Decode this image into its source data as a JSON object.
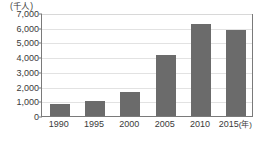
{
  "chart_data": {
    "type": "bar",
    "title": "",
    "xlabel": "年",
    "ylabel": "千人",
    "unit_label": "(千人)",
    "axis_suffix": "(年)",
    "categories": [
      "1990",
      "1995",
      "2000",
      "2005",
      "2010",
      "2015"
    ],
    "values": [
      800,
      1030,
      1650,
      4120,
      6270,
      5840
    ],
    "ylim": [
      0,
      7000
    ],
    "ytick_step": 1000,
    "ytick_labels": [
      "7,000",
      "6,000",
      "5,000",
      "4,000",
      "3,000",
      "2,000",
      "1,000",
      "0"
    ],
    "ytick_values": [
      7000,
      6000,
      5000,
      4000,
      3000,
      2000,
      1000,
      0
    ],
    "grid": true,
    "legend": false,
    "bar_color": "#6b6b6b",
    "grid_color": "#e2e2e2",
    "axis_color": "#7a7a7a",
    "background": "#ffffff",
    "series": [
      {
        "name": "人数",
        "values": [
          800,
          1030,
          1650,
          4120,
          6270,
          5840
        ]
      }
    ]
  }
}
